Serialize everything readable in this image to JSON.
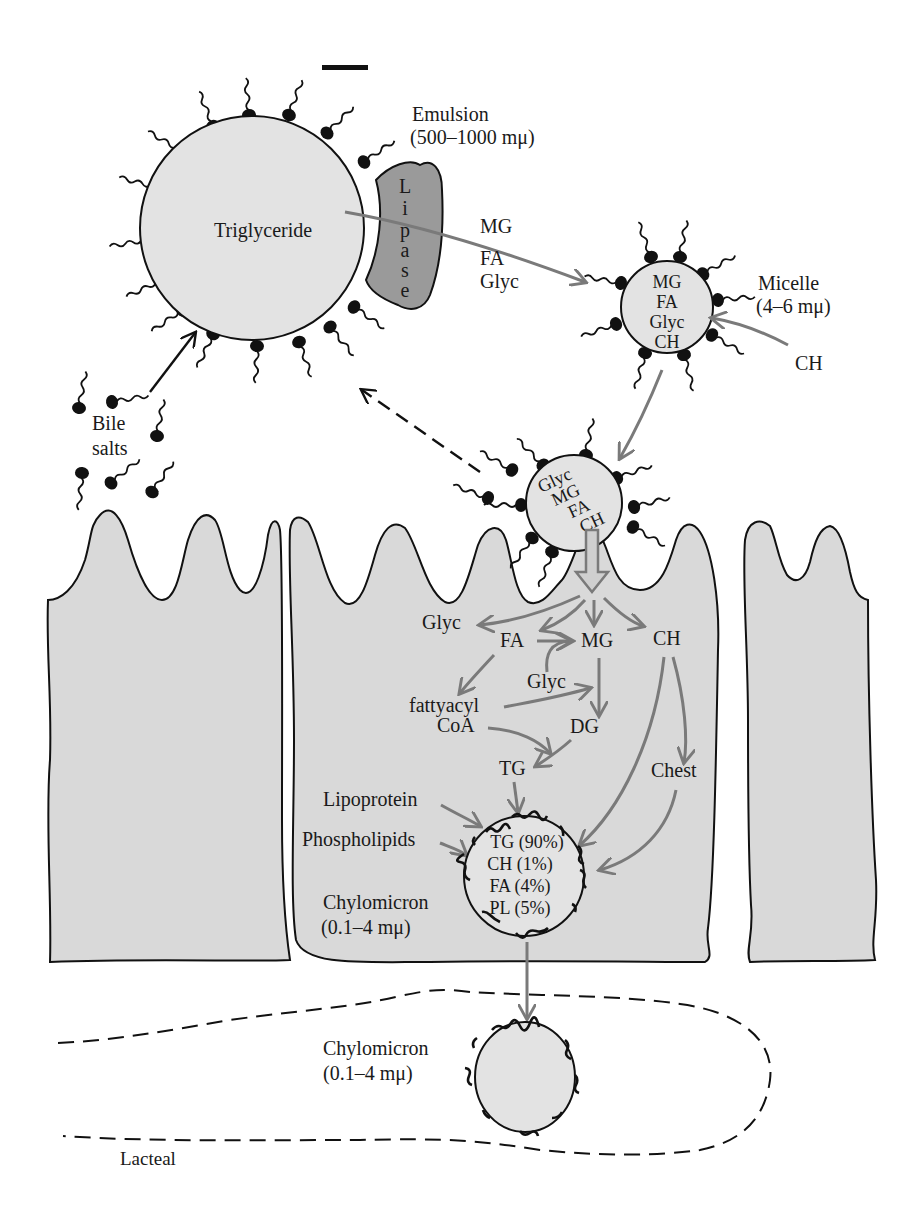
{
  "figure": {
    "colors": {
      "cell_fill": "#d9d9d9",
      "droplet_fill": "#e3e3e3",
      "lipase_fill": "#9a9a9a",
      "pathway_arrow": "#7a7a7a",
      "ink": "#111111"
    }
  },
  "emulsion": {
    "core_label": "Triglyceride",
    "name": "Emulsion",
    "size": "(500–1000 mμ)"
  },
  "lipase": {
    "letters": [
      "L",
      "i",
      "p",
      "a",
      "s",
      "e"
    ]
  },
  "products": {
    "items": [
      "MG",
      "FA",
      "Glyc"
    ]
  },
  "micelle": {
    "contents": [
      "MG",
      "FA",
      "Glyc",
      "CH"
    ],
    "name": "Micelle",
    "size": "(4–6 mμ)",
    "incoming": "CH"
  },
  "bile": {
    "line1": "Bile",
    "line2": "salts"
  },
  "membrane_micelle": {
    "contents": [
      "Glyc",
      "MG",
      "FA",
      "CH"
    ]
  },
  "pathway": {
    "glyc_top": "Glyc",
    "fa": "FA",
    "mg": "MG",
    "ch": "CH",
    "glyc_mid": "Glyc",
    "fattyacyl_1": "fattyacyl",
    "fattyacyl_2": "CoA",
    "dg": "DG",
    "tg": "TG",
    "chest": "Chest"
  },
  "chylomicron_cell": {
    "lipoprotein": "Lipoprotein",
    "phospholipids": "Phospholipids",
    "name": "Chylomicron",
    "size": "(0.1–4 mμ)",
    "composition": [
      "TG (90%)",
      "CH (1%)",
      "FA (4%)",
      "PL (5%)"
    ]
  },
  "lacteal": {
    "label": "Lacteal",
    "chylomicron_name": "Chylomicron",
    "chylomicron_size": "(0.1–4 mμ)"
  }
}
